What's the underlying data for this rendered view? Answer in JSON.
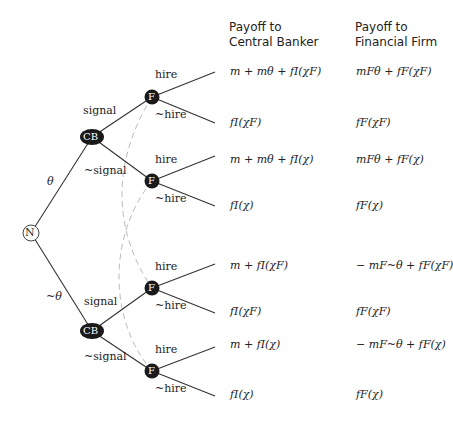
{
  "headers": {
    "central_banker": "Payoff to\nCentral Banker",
    "central_banker_line1": "Payoff to",
    "central_banker_line2": "Central Banker",
    "financial_firm_line1": "Payoff to",
    "financial_firm_line2": "Financial Firm"
  },
  "nodes": {
    "nature": "N",
    "cb_top": "CB",
    "cb_bottom": "CB",
    "f1": "F",
    "f2": "F",
    "f3": "F",
    "f4": "F"
  },
  "edge_labels": {
    "theta": "θ",
    "not_theta": "~θ",
    "signal_top": "signal",
    "not_signal_top": "~signal",
    "signal_bottom": "signal",
    "not_signal_bottom": "~signal",
    "hire_1": "hire",
    "not_hire_1": "~hire",
    "hire_2": "hire",
    "not_hire_2": "~hire",
    "hire_3": "hire",
    "not_hire_3": "~hire",
    "hire_4": "hire",
    "not_hire_4": "~hire"
  },
  "payoffs": [
    {
      "cb": "m + mθ + fI(χF)",
      "firm": "mFθ + fF(χF)"
    },
    {
      "cb": "fI(χF)",
      "firm": "fF(χF)"
    },
    {
      "cb": "m + mθ + fI(χ)",
      "firm": "mFθ + fF(χ)"
    },
    {
      "cb": "fI(χ)",
      "firm": "fF(χ)"
    },
    {
      "cb": "m + fI(χF)",
      "firm": "− mF~θ + fF(χF)"
    },
    {
      "cb": "fI(χF)",
      "firm": "fF(χF)"
    },
    {
      "cb": "m + fI(χ)",
      "firm": "− mF~θ + fF(χ)"
    },
    {
      "cb": "fI(χ)",
      "firm": "fF(χ)"
    }
  ],
  "colors": {
    "line": "#333333",
    "node_fill": "#1a1a1a",
    "dashed": "#bbbbbb"
  }
}
